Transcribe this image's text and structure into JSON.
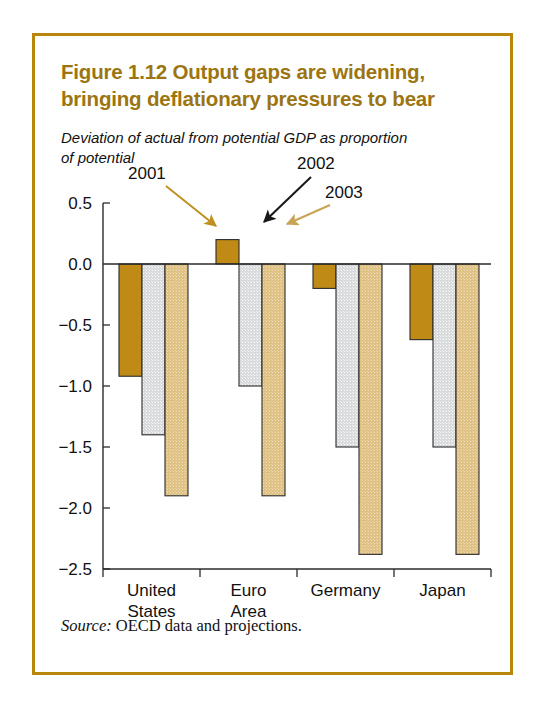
{
  "figure": {
    "title_line1": "Figure 1.12  Output gaps are widening,",
    "title_line2": "bringing deflationary pressures to bear",
    "subtitle_line1": "Deviation of actual from potential GDP as proportion",
    "subtitle_line2": "of potential",
    "source_label": "Source:",
    "source_text": " OECD data and projections.",
    "frame_color": "#b8860b",
    "title_color": "#9c7512"
  },
  "chart_data": {
    "type": "bar",
    "title": "Figure 1.12  Output gaps are widening, bringing deflationary pressures to bear",
    "subtitle": "Deviation of actual from potential GDP as proportion of potential",
    "xlabel": "",
    "ylabel": "",
    "ylim": [
      -2.5,
      0.5
    ],
    "yticks": [
      0.5,
      0.0,
      -0.5,
      -1.0,
      -1.5,
      -2.0,
      -2.5
    ],
    "ytick_labels": [
      "0.5",
      "0.0",
      "−0.5",
      "−1.0",
      "−1.5",
      "−2.0",
      "−2.5"
    ],
    "grid": false,
    "legend": "annotated-arrows",
    "categories": [
      "United States",
      "Euro Area",
      "Germany",
      "Japan"
    ],
    "category_label_lines": [
      [
        "United",
        "States"
      ],
      [
        "Euro",
        "Area"
      ],
      [
        "Germany"
      ],
      [
        "Japan"
      ]
    ],
    "series": [
      {
        "name": "2001",
        "color": "#c08a16",
        "values": [
          -0.92,
          0.2,
          -0.2,
          -0.62
        ]
      },
      {
        "name": "2002",
        "color": "#d9dadb",
        "values": [
          -1.4,
          -1.0,
          -1.5,
          -1.5
        ]
      },
      {
        "name": "2003",
        "color": "#dfc183",
        "values": [
          -1.9,
          -1.9,
          -2.38,
          -2.38
        ]
      }
    ],
    "annotations": [
      {
        "label": "2001",
        "arrow_color": "#c09022",
        "points_to": "Euro Area 2001 bar"
      },
      {
        "label": "2002",
        "arrow_color": "#1a1a1a",
        "points_to": "Euro Area 2002 bar"
      },
      {
        "label": "2003",
        "arrow_color": "#c9a455",
        "points_to": "Euro Area 2003 bar"
      }
    ]
  }
}
